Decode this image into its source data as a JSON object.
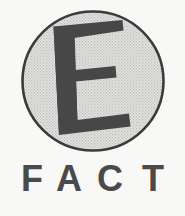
{
  "logo": {
    "name": "E FACT",
    "emblem": {
      "icon_name": "circle-letter-e-emblem",
      "letter": "E",
      "shape": "circle",
      "alt_text": "Stylized capital letter E inside a shaded circle"
    },
    "wordmark": {
      "text": "FACT",
      "letters": [
        "F",
        "A",
        "C",
        "T"
      ],
      "style": "bold condensed sans-serif, wide letter spacing"
    },
    "colors": {
      "background": "#f8f8f7",
      "circle_fill": "#d6d6d4",
      "circle_outline": "#3c3c3c",
      "letter_fill": "#474747",
      "wordmark_fill": "#4a4a4a"
    }
  }
}
